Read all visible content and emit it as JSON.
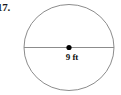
{
  "figure": {
    "problem_number": "17.",
    "shape": "circle",
    "measurement_label": "9 ft",
    "measurement_value": 9,
    "measurement_unit": "ft",
    "measurement_type": "diameter",
    "center_marker": "center-dot",
    "colors": {
      "background": "#ffffff",
      "outline": "#8c8c8c",
      "diameter_line": "#8c8c8c",
      "center_dot": "#000000",
      "text": "#111111",
      "problem_number_text": "#1a1a1a"
    },
    "geometry": {
      "center_x": 69,
      "center_y": 47.5,
      "radius_x": 45,
      "radius_y": 43,
      "diameter_line_y": 47.5,
      "diameter_line_x1": 24,
      "diameter_line_x2": 114
    }
  }
}
